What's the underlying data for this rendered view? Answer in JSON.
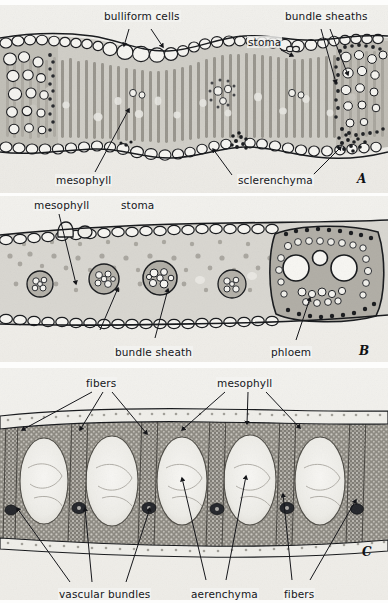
{
  "figure": {
    "kind": "plant-anatomy-micrograph-plate",
    "background_color": "#f2f1ed",
    "ink_color": "#15161a",
    "panel_count": 3
  },
  "panels": [
    {
      "id": "A",
      "plate_letter": "A",
      "subject": "grass leaf cross section",
      "labels": [
        {
          "name": "bulliform-cells",
          "text": "bulliform cells",
          "x": 103,
          "y": 10
        },
        {
          "name": "bundle-sheaths",
          "text": "bundle sheaths",
          "x": 286,
          "y": 10
        },
        {
          "name": "stoma",
          "text": "stoma",
          "x": 247,
          "y": 36
        },
        {
          "name": "mesophyll",
          "text": "mesophyll",
          "x": 55,
          "y": 174
        },
        {
          "name": "sclerenchyma",
          "text": "sclerenchyma",
          "x": 237,
          "y": 174
        }
      ],
      "letter_pos": {
        "x": 357,
        "y": 172
      }
    },
    {
      "id": "B",
      "plate_letter": "B",
      "subject": "dicot leaf cross section",
      "labels": [
        {
          "name": "mesophyll",
          "text": "mesophyll",
          "x": 33,
          "y": 199
        },
        {
          "name": "stoma",
          "text": "stoma",
          "x": 120,
          "y": 199
        },
        {
          "name": "bundle-sheath",
          "text": "bundle sheath",
          "x": 115,
          "y": 346
        },
        {
          "name": "phloem",
          "text": "phloem",
          "x": 270,
          "y": 346
        }
      ],
      "letter_pos": {
        "x": 359,
        "y": 344
      }
    },
    {
      "id": "C",
      "plate_letter": "C",
      "subject": "aquatic leaf cross section with aerenchyma",
      "labels": [
        {
          "name": "fibers-top",
          "text": "fibers",
          "x": 85,
          "y": 377
        },
        {
          "name": "mesophyll",
          "text": "mesophyll",
          "x": 216,
          "y": 377
        },
        {
          "name": "vascular-bundles",
          "text": "vascular bundles",
          "x": 58,
          "y": 588
        },
        {
          "name": "aerenchyma",
          "text": "aerenchyma",
          "x": 190,
          "y": 588
        },
        {
          "name": "fibers-bottom",
          "text": "fibers",
          "x": 283,
          "y": 588
        }
      ],
      "letter_pos": {
        "x": 362,
        "y": 545
      }
    }
  ],
  "panel_geometry": [
    {
      "id": "A",
      "top": 5,
      "height": 188
    },
    {
      "id": "B",
      "top": 196,
      "height": 166
    },
    {
      "id": "C",
      "top": 368,
      "height": 232
    }
  ],
  "terms_glossary": [
    "bulliform cells",
    "bundle sheaths",
    "stoma",
    "mesophyll",
    "sclerenchyma",
    "bundle sheath",
    "phloem",
    "fibers",
    "vascular bundles",
    "aerenchyma"
  ]
}
